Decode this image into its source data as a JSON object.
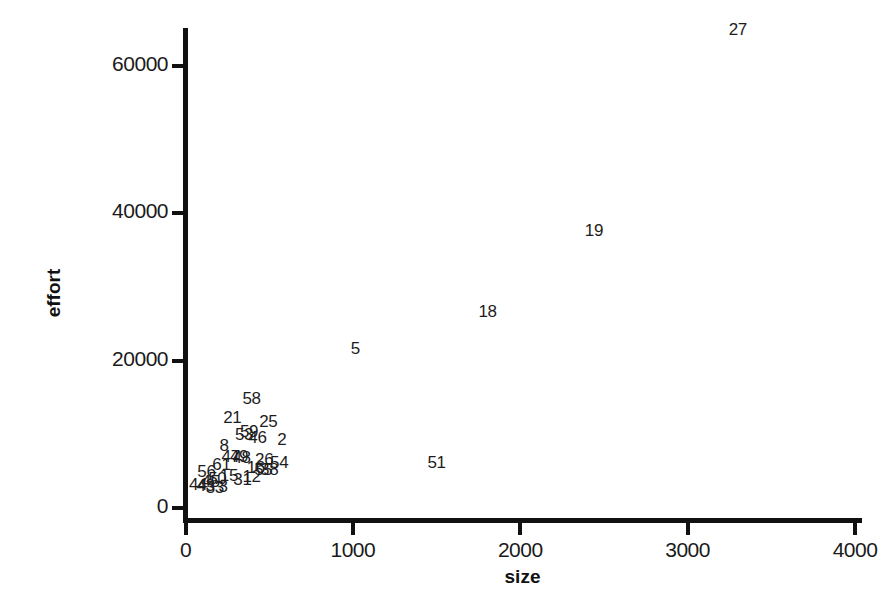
{
  "chart_data": {
    "type": "scatter",
    "title": "",
    "xlabel": "size",
    "ylabel": "effort",
    "xlim": [
      0,
      4150
    ],
    "ylim": [
      0,
      67000
    ],
    "xticks": [
      0,
      1000,
      2000,
      3000,
      4000
    ],
    "xtick_labels": [
      "0",
      "1000",
      "2000",
      "3000",
      "4000"
    ],
    "yticks": [
      0,
      20000,
      40000,
      60000
    ],
    "ytick_labels": [
      "0",
      "20000",
      "40000",
      "60000"
    ],
    "grid": false,
    "legend": null,
    "marker_style": "case-number-label",
    "points": [
      {
        "label": "27",
        "size": 3300,
        "effort": 65000
      },
      {
        "label": "19",
        "size": 2440,
        "effort": 37800
      },
      {
        "label": "18",
        "size": 1805,
        "effort": 26800
      },
      {
        "label": "5",
        "size": 1015,
        "effort": 21700
      },
      {
        "label": "51",
        "size": 1500,
        "effort": 6300
      },
      {
        "label": "58",
        "size": 395,
        "effort": 15000
      },
      {
        "label": "21",
        "size": 280,
        "effort": 12400
      },
      {
        "label": "25",
        "size": 495,
        "effort": 11800
      },
      {
        "label": "59",
        "size": 380,
        "effort": 10500
      },
      {
        "label": "53",
        "size": 350,
        "effort": 10100
      },
      {
        "label": "46",
        "size": 430,
        "effort": 9700
      },
      {
        "label": "2",
        "size": 575,
        "effort": 9300
      },
      {
        "label": "8",
        "size": 230,
        "effort": 8600
      },
      {
        "label": "47",
        "size": 270,
        "effort": 7100
      },
      {
        "label": "49",
        "size": 320,
        "effort": 7100
      },
      {
        "label": "48",
        "size": 335,
        "effort": 6900
      },
      {
        "label": "26",
        "size": 470,
        "effort": 6700
      },
      {
        "label": "54",
        "size": 560,
        "effort": 6200
      },
      {
        "label": "61",
        "size": 215,
        "effort": 6000
      },
      {
        "label": "16",
        "size": 420,
        "effort": 5500
      },
      {
        "label": "55",
        "size": 465,
        "effort": 5300
      },
      {
        "label": "38",
        "size": 500,
        "effort": 5300
      },
      {
        "label": "56",
        "size": 125,
        "effort": 5000
      },
      {
        "label": "15",
        "size": 260,
        "effort": 4500
      },
      {
        "label": "50",
        "size": 190,
        "effort": 4100
      },
      {
        "label": "31",
        "size": 340,
        "effort": 3900
      },
      {
        "label": "12",
        "size": 395,
        "effort": 4400
      },
      {
        "label": "44",
        "size": 75,
        "effort": 3200
      },
      {
        "label": "43",
        "size": 120,
        "effort": 3100
      },
      {
        "label": "33",
        "size": 175,
        "effort": 2800
      },
      {
        "label": "45",
        "size": 150,
        "effort": 3600
      },
      {
        "label": "3",
        "size": 225,
        "effort": 3000
      }
    ]
  }
}
